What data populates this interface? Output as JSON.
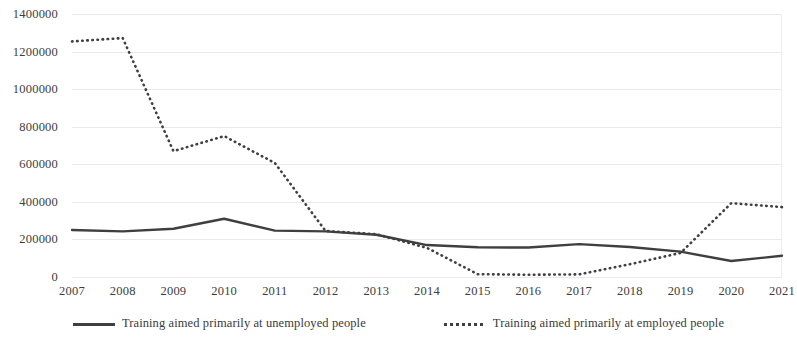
{
  "chart_data": {
    "type": "line",
    "title": "",
    "xlabel": "",
    "ylabel": "",
    "grid": true,
    "legend_position": "bottom",
    "categories": [
      "2007",
      "2008",
      "2009",
      "2010",
      "2011",
      "2012",
      "2013",
      "2014",
      "2015",
      "2016",
      "2017",
      "2018",
      "2019",
      "2020",
      "2021"
    ],
    "x": [
      2007,
      2008,
      2009,
      2010,
      2011,
      2012,
      2013,
      2014,
      2015,
      2016,
      2017,
      2018,
      2019,
      2020,
      2021
    ],
    "ylim": [
      0,
      1400000
    ],
    "y_ticks": [
      0,
      200000,
      400000,
      600000,
      800000,
      1000000,
      1200000,
      1400000
    ],
    "y_tick_labels": [
      "0",
      "200000",
      "400000",
      "600000",
      "800000",
      "1000000",
      "1200000",
      "1400000"
    ],
    "series": [
      {
        "name": "Training aimed primarily at unemployed people",
        "style": "solid",
        "color": "#3f3f3f",
        "values": [
          250000,
          243000,
          257000,
          310000,
          247000,
          243000,
          225000,
          170000,
          158000,
          157000,
          175000,
          160000,
          135000,
          85000,
          113000
        ]
      },
      {
        "name": "Training aimed primarily at employed people",
        "style": "dotted",
        "color": "#3f3f3f",
        "values": [
          1254000,
          1272000,
          670000,
          750000,
          607000,
          245000,
          228000,
          155000,
          15000,
          12000,
          14000,
          68000,
          128000,
          393000,
          372000
        ]
      }
    ]
  },
  "axes": {
    "y_labels": [
      "1400000",
      "1200000",
      "1000000",
      "800000",
      "600000",
      "400000",
      "200000",
      "0"
    ],
    "x_labels": [
      "2007",
      "2008",
      "2009",
      "2010",
      "2011",
      "2012",
      "2013",
      "2014",
      "2015",
      "2016",
      "2017",
      "2018",
      "2019",
      "2020",
      "2021"
    ]
  },
  "legend": {
    "items": [
      {
        "label": "Training aimed primarily at unemployed people",
        "style": "solid",
        "swatch": "solid-line-swatch"
      },
      {
        "label": "Training aimed primarily at employed people",
        "style": "dotted",
        "swatch": "dotted-line-swatch"
      }
    ]
  },
  "colors": {
    "series": "#3f3f3f",
    "grid": "#e9e9e9",
    "text": "#3a3a3a",
    "background": "#ffffff"
  }
}
